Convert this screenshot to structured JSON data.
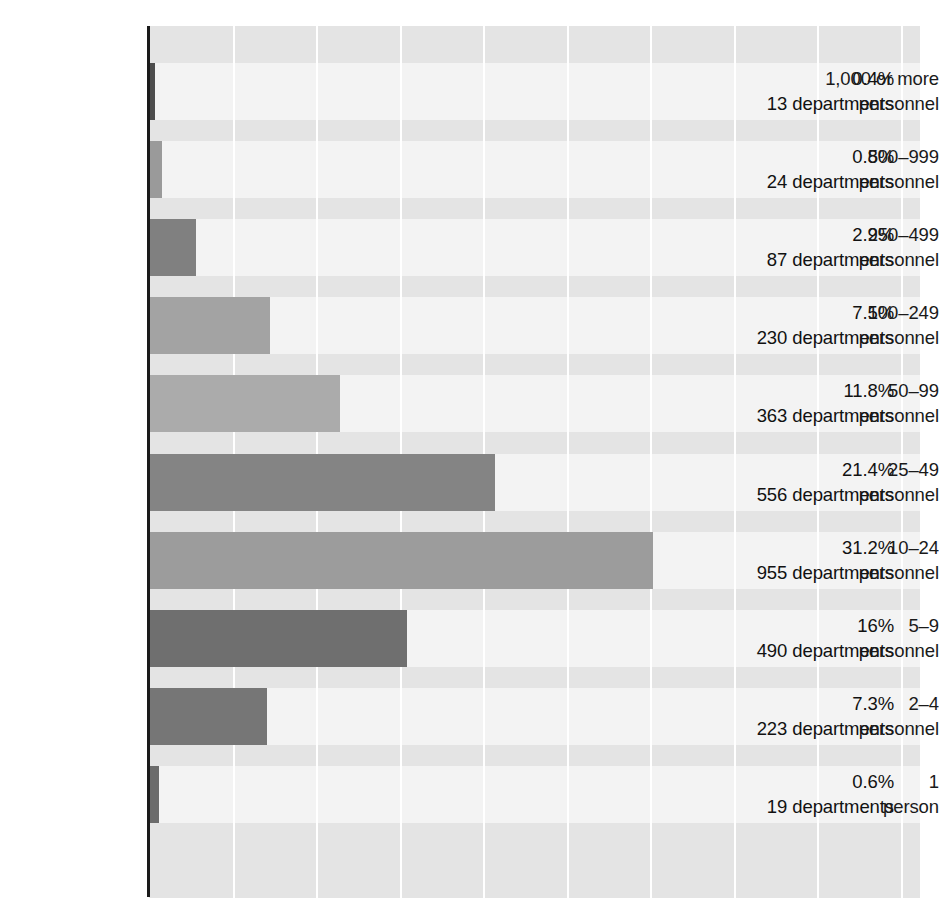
{
  "chart_data": {
    "type": "bar",
    "orientation": "horizontal",
    "title": "",
    "subtitle": "",
    "xlabel": "",
    "ylabel": "",
    "xlim": [
      0,
      47.7
    ],
    "grid": true,
    "legend": false,
    "axis_tick_labels": [],
    "value_unit": "percent",
    "count_unit": "departments",
    "categories": [
      "1,000 or more personnel",
      "500–999 personnel",
      "250–499 personnel",
      "100–249 personnel",
      "50–99 personnel",
      "25–49 personnel",
      "10–24 personnel",
      "5–9 personnel",
      "2–4 personnel",
      "1 person"
    ],
    "values": [
      0.4,
      0.8,
      2.9,
      7.5,
      11.8,
      21.4,
      31.2,
      16.0,
      7.3,
      0.6
    ],
    "counts": [
      13,
      24,
      87,
      230,
      363,
      556,
      955,
      490,
      223,
      19
    ],
    "bar_colors": [
      "#4d4d4d",
      "#9a9a9a",
      "#808080",
      "#a3a3a3",
      "#ababab",
      "#848484",
      "#9c9c9c",
      "#6f6f6f",
      "#767676",
      "#6b6b6b"
    ]
  },
  "chart": {
    "rows": [
      {
        "category_line1": "1,000 or more",
        "category_line2": "personnel",
        "percent_label": "0.4%",
        "count_label": "13 departments"
      },
      {
        "category_line1": "500–999",
        "category_line2": "personnel",
        "percent_label": "0.8%",
        "count_label": "24 departments"
      },
      {
        "category_line1": "250–499",
        "category_line2": "personnel",
        "percent_label": "2.9%",
        "count_label": "87 departments"
      },
      {
        "category_line1": "100–249",
        "category_line2": "personnel",
        "percent_label": "7.5%",
        "count_label": "230 departments"
      },
      {
        "category_line1": "50–99",
        "category_line2": "personnel",
        "percent_label": "11.8%",
        "count_label": "363 departments"
      },
      {
        "category_line1": "25–49",
        "category_line2": "personnel",
        "percent_label": "21.4%",
        "count_label": "556 departments"
      },
      {
        "category_line1": "10–24",
        "category_line2": "personnel",
        "percent_label": "31.2%",
        "count_label": "955 departments"
      },
      {
        "category_line1": "5–9",
        "category_line2": "personnel",
        "percent_label": "16%",
        "count_label": "490 departments"
      },
      {
        "category_line1": "2–4",
        "category_line2": "personnel",
        "percent_label": "7.3%",
        "count_label": "223 departments"
      },
      {
        "category_line1": "1",
        "category_line2": "person",
        "percent_label": "0.6%",
        "count_label": "19 departments"
      }
    ],
    "colors": {
      "plot_background": "#e4e4e4",
      "row_band": "#f3f3f3",
      "gridline": "#ffffff",
      "axis": "#1a1a1a",
      "text": "#111111"
    }
  }
}
